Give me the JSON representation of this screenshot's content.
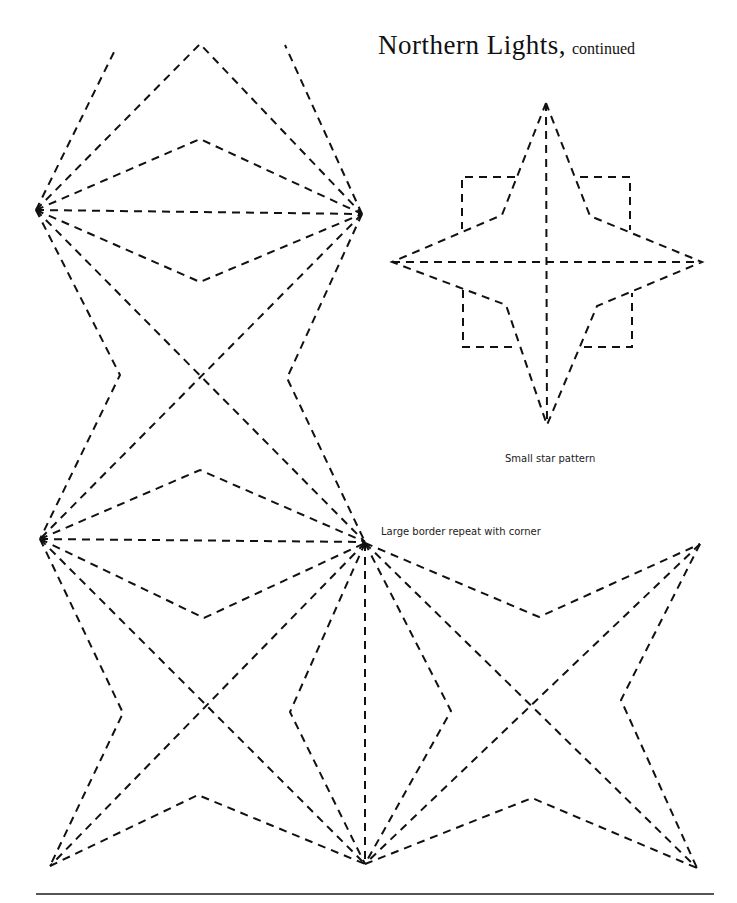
{
  "page": {
    "title": "Northern Lights,",
    "title_suffix": "continued",
    "captions": {
      "small_star": "Small star pattern",
      "large_border": "Large border repeat with corner"
    },
    "colors": {
      "ink": "#111111",
      "rule": "#555555",
      "background": "#ffffff"
    }
  }
}
